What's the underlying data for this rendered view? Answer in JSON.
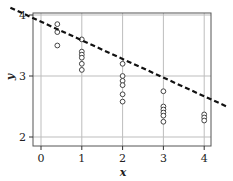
{
  "chart_data": {
    "type": "scatter",
    "title": "",
    "xlabel": "x",
    "ylabel": "y",
    "xlim": [
      -0.2,
      4.2
    ],
    "ylim": [
      1.95,
      4.0
    ],
    "x_ticks": [
      0,
      1,
      2,
      3,
      4
    ],
    "y_ticks": [
      2,
      3,
      4
    ],
    "x_tick_labels": [
      "0",
      "1",
      "2",
      "3",
      "4"
    ],
    "y_tick_labels": [
      "2",
      "3",
      "4"
    ],
    "grid": true,
    "legend": null,
    "series": [
      {
        "name": "observations",
        "marker": "open-circle",
        "points": [
          [
            0.4,
            3.85
          ],
          [
            0.4,
            3.72
          ],
          [
            0.4,
            3.5
          ],
          [
            1,
            3.6
          ],
          [
            1,
            3.4
          ],
          [
            1,
            3.35
          ],
          [
            1,
            3.3
          ],
          [
            1,
            3.2
          ],
          [
            1,
            3.1
          ],
          [
            2,
            3.2
          ],
          [
            2,
            3.0
          ],
          [
            2,
            2.92
          ],
          [
            2,
            2.85
          ],
          [
            2,
            2.7
          ],
          [
            2,
            2.58
          ],
          [
            3,
            2.75
          ],
          [
            3,
            2.5
          ],
          [
            3,
            2.45
          ],
          [
            3,
            2.4
          ],
          [
            3,
            2.35
          ],
          [
            3,
            2.25
          ],
          [
            4,
            2.37
          ],
          [
            4,
            2.32
          ],
          [
            4,
            2.27
          ]
        ]
      },
      {
        "name": "regression line",
        "style": "dashed",
        "color": "#111111",
        "line": {
          "x_start": -0.75,
          "y_start": 4.12,
          "x_end": 4.55,
          "y_end": 2.5
        }
      }
    ]
  }
}
